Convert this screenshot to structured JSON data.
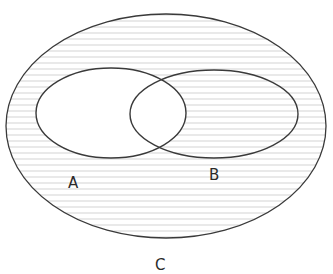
{
  "diagram": {
    "type": "venn",
    "universe_label": "C",
    "sets": [
      {
        "name": "A",
        "label": "A"
      },
      {
        "name": "B",
        "label": "B"
      }
    ],
    "shaded_region": "complement of A (everything in C outside A, including B only)",
    "shading_style": "horizontal lines",
    "colors": {
      "stroke": "#3a3a3a",
      "hatch": "#c8c8c8",
      "background": "#ffffff"
    }
  }
}
